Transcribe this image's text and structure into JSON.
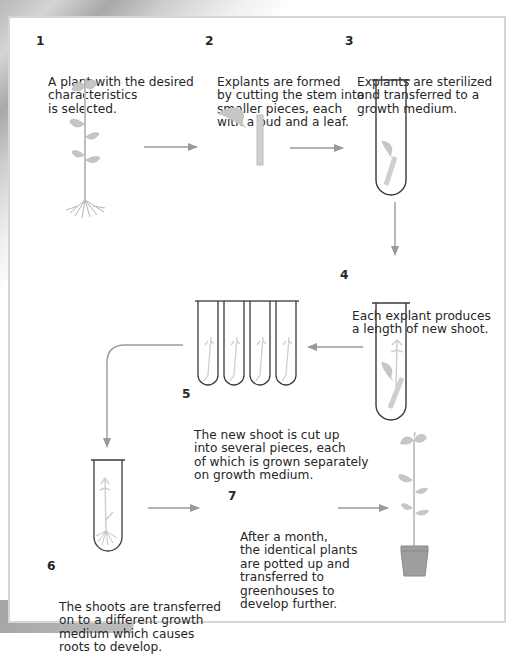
{
  "diagram": {
    "steps": [
      {
        "num": "1",
        "text": "A plant with the desired\ncharacteristics\nis selected."
      },
      {
        "num": "2",
        "text": "Explants are formed\nby cutting the stem into\nsmaller pieces, each\nwith a bud and a leaf."
      },
      {
        "num": "3",
        "text": "Explants are sterilized\nand transferred to a\ngrowth medium."
      },
      {
        "num": "4",
        "text": "Each explant produces\na length of new shoot."
      },
      {
        "num": "5",
        "text": "The new shoot is cut up\ninto several pieces, each\nof which is grown separately\non growth medium."
      },
      {
        "num": "6",
        "text": "The shoots are transferred\non to a different growth\nmedium which causes\nroots to develop."
      },
      {
        "num": "7",
        "text": "After a month,\nthe identical plants\nare potted up and\ntransferred to\ngreenhouses to\ndevelop further."
      }
    ],
    "illustrations": [
      {
        "id": "parent-plant",
        "label": "plant with roots"
      },
      {
        "id": "explant",
        "label": "stem piece with bud and leaf"
      },
      {
        "id": "tube-explant",
        "label": "test tube with explant"
      },
      {
        "id": "tube-shoot",
        "label": "test tube with new shoot"
      },
      {
        "id": "tubes-pieces",
        "label": "four test tubes with shoot pieces"
      },
      {
        "id": "tube-roots",
        "label": "test tube with rooted shoot"
      },
      {
        "id": "potted-plant",
        "label": "plant in pot"
      }
    ],
    "colors": {
      "text": "#262626",
      "plant": "#c2c2c2",
      "arrow": "#9a9a9a",
      "tube": "#3a3a3a",
      "border": "#d6d6d6"
    }
  }
}
